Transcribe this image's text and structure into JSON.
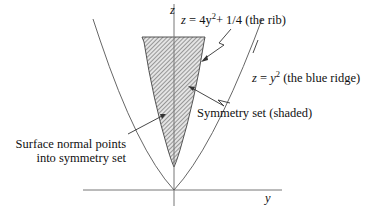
{
  "axes": {
    "vertical_label": "z",
    "horizontal_label": "y"
  },
  "labels": {
    "rib": {
      "lhs": "z",
      "eq": " = ",
      "coef": "4y",
      "exp": "2",
      "rest": "+ 1/4",
      "desc": " (the rib)"
    },
    "ridge": {
      "lhs": "z",
      "eq": " = ",
      "var": "y",
      "exp": "2",
      "desc": " (the blue ridge)"
    },
    "symmetry_set": "Symmetry set (shaded)",
    "normal_line1": "Surface normal points",
    "normal_line2": "into symmetry set"
  },
  "colors": {
    "line": "#333333",
    "hatch": "#555555",
    "axis": "#777777"
  }
}
